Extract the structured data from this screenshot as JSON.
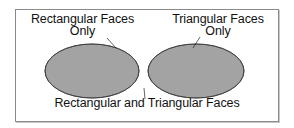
{
  "diagram": {
    "type": "venn",
    "sets": [
      {
        "id": "rectangular",
        "label_line1": "Rectangular Faces",
        "label_line2": "Only",
        "fill": "#a3a3a3"
      },
      {
        "id": "triangular",
        "label_line1": "Triangular Faces",
        "label_line2": "Only",
        "fill": "#a3a3a3"
      }
    ],
    "intersection": {
      "label": "Rectangular and Triangular Faces",
      "fill": "#555555"
    },
    "outline_color": "#3a3a3a",
    "frame_color": "#8a8a8a"
  }
}
